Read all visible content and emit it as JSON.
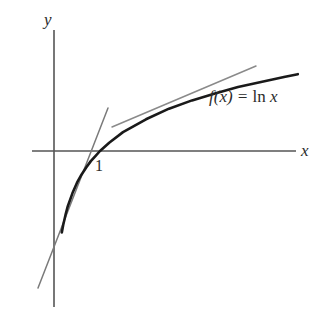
{
  "figure": {
    "background_color": "#ffffff",
    "width": 327,
    "height": 316
  },
  "axes": {
    "x_label": "x",
    "y_label": "y",
    "axis_color": "#555555",
    "origin_px": [
      54,
      151
    ],
    "x_axis_span_px": [
      32,
      296
    ],
    "y_axis_span_px": [
      30,
      307
    ]
  },
  "annotations": {
    "tick_label": "1",
    "tick_x_px": 100,
    "function_label_f": "f(x) = ",
    "function_label_ln": "ln",
    "function_label_arg": " x",
    "function_label_full": "f(x) = ln x"
  },
  "curve": {
    "name": "natural-log-curve",
    "color": "#1a1a1a",
    "stroke_width": 2.6,
    "equation": "f(x) = ln x",
    "x_intercept": 1,
    "unit_x_px": 46,
    "unit_y_px": 46
  },
  "tangent_lines": [
    {
      "name": "tangent-at-one",
      "color": "#7a7a7a",
      "stroke_width": 1.5,
      "point_of_tangency": 1,
      "slope": 1,
      "from_px": [
        38,
        288
      ],
      "to_px": [
        108,
        108
      ]
    },
    {
      "name": "secant-upper",
      "color": "#8a8a8a",
      "stroke_width": 1.5,
      "from_px": [
        112,
        127
      ],
      "to_px": [
        256,
        66
      ]
    }
  ],
  "chart_data": {
    "type": "line",
    "title": "f(x) = ln x",
    "xlabel": "x",
    "ylabel": "y",
    "grid": false,
    "legend": null,
    "series": [
      {
        "name": "f(x) = ln x",
        "color": "#1a1a1a",
        "x": [
          0.17,
          0.2,
          0.25,
          0.3,
          0.4,
          0.5,
          0.6,
          0.7,
          0.8,
          0.9,
          1.0,
          1.2,
          1.5,
          2.0,
          2.5,
          3.0,
          3.5,
          4.0,
          4.5,
          5.0,
          5.3
        ],
        "y": [
          -1.77,
          -1.61,
          -1.39,
          -1.2,
          -0.92,
          -0.69,
          -0.51,
          -0.36,
          -0.22,
          -0.11,
          0.0,
          0.18,
          0.41,
          0.69,
          0.92,
          1.1,
          1.25,
          1.39,
          1.5,
          1.61,
          1.67
        ]
      },
      {
        "name": "tangent at x = 1",
        "color": "#7a7a7a",
        "x": [
          -0.35,
          1.0,
          1.17
        ],
        "y": [
          -1.35,
          0.0,
          0.17
        ]
      },
      {
        "name": "secant line",
        "color": "#8a8a8a",
        "x": [
          1.26,
          4.4
        ],
        "y": [
          0.52,
          1.85
        ]
      }
    ],
    "xlim": [
      -0.5,
      5.4
    ],
    "ylim": [
      -3.4,
      2.65
    ],
    "annotations": [
      {
        "text": "1",
        "x": 1.0,
        "y": -0.22
      },
      {
        "text": "f(x) = ln x",
        "x": 3.5,
        "y": 1.05
      }
    ]
  }
}
